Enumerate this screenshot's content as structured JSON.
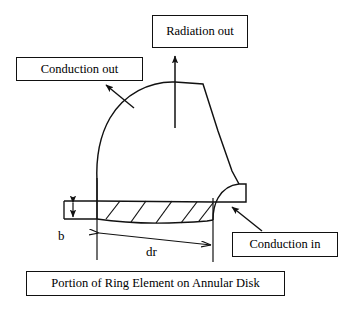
{
  "figure": {
    "title": "Portion of Ring Element on Annular Disk",
    "type": "engineering-schematic"
  },
  "callouts": {
    "radiation_out": "Radiation out",
    "conduction_out": "Conduction out",
    "conduction_in": "Conduction in"
  },
  "caption": {
    "text": "Portion of Ring Element on Annular Disk"
  },
  "dimensions": {
    "thickness_label": "b",
    "radial_label": "dr"
  },
  "icons": {
    "radiation_arrow": "up-arrow-icon",
    "conduction_out_arrow": "diagonal-arrow-up-left-icon",
    "conduction_in_arrow": "diagonal-arrow-up-left-icon",
    "thickness_arrow": "double-headed-vertical-arrow-icon",
    "radial_arrow": "double-headed-horizontal-arrow-icon"
  },
  "colors": {
    "stroke": "#111111",
    "background": "#ffffff",
    "text": "#000000"
  },
  "geometry": {
    "hatch_line_count": 5,
    "dome_apex_y": 82,
    "band_top_y": 201,
    "band_bottom_y": 222
  }
}
